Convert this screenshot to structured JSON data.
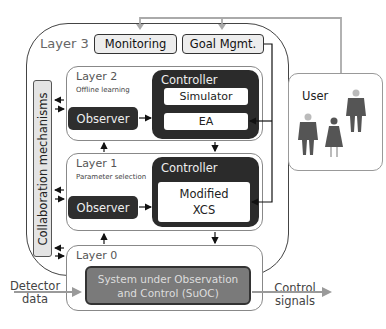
{
  "layer3": {
    "label": "Layer 3",
    "monitoring": "Monitoring",
    "goal_mgmt": "Goal Mgmt."
  },
  "collaboration": {
    "label": "Collaboration mechanisms"
  },
  "layer2": {
    "title": "Layer 2",
    "subtitle": "Offline learning",
    "observer": "Observer",
    "controller": "Controller",
    "simulator": "Simulator",
    "ea": "EA"
  },
  "layer1": {
    "title": "Layer 1",
    "subtitle": "Parameter selection",
    "observer": "Observer",
    "controller": "Controller",
    "xcs_line1": "Modified",
    "xcs_line2": "XCS"
  },
  "layer0": {
    "title": "Layer 0",
    "suoc_line1": "System under Observation",
    "suoc_line2": "and Control (SuOC)"
  },
  "user": {
    "label": "User"
  },
  "io": {
    "input_line1": "Detector",
    "input_line2": "data",
    "output_line1": "Control",
    "output_line2": "signals"
  },
  "colors": {
    "dark_box": "#2b2b2b",
    "suoc_fill": "#7a7a7a",
    "flow_arrow": "#9a9a9a",
    "outline": "#444444"
  }
}
